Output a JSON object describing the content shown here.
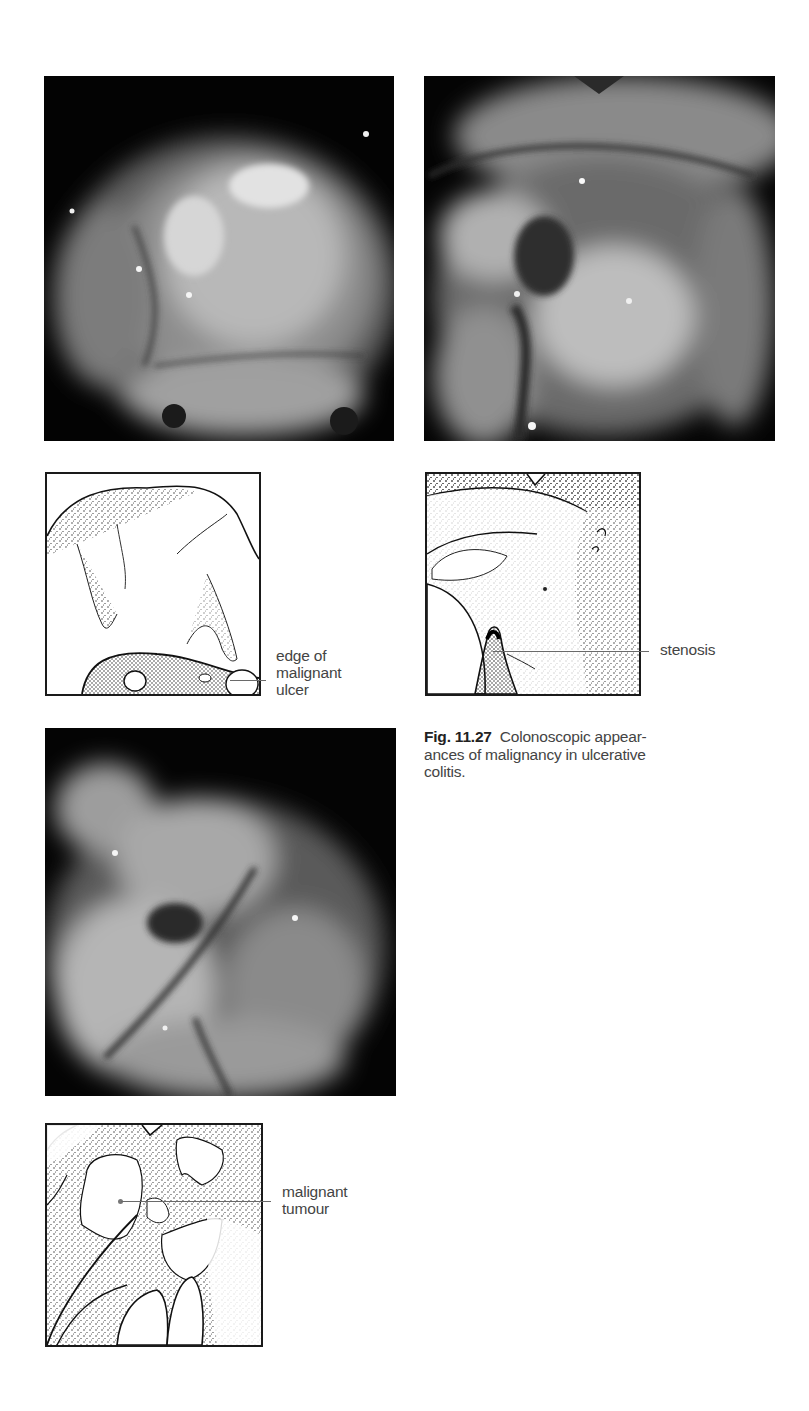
{
  "figure": {
    "number": "Fig. 11.27",
    "caption": "Colonoscopic appear-ances of malignancy in ulcerative colitis.",
    "caption_lines": [
      "Colonoscopic appear-",
      "ances of malignancy in ulcerative",
      "colitis."
    ]
  },
  "panels": [
    {
      "id": "panel-1",
      "photo_description": "endoscopic photograph, greyscale",
      "diagram_label_lines": [
        "edge of",
        "malignant",
        "ulcer"
      ],
      "diagram_label": "edge of malignant ulcer"
    },
    {
      "id": "panel-2",
      "photo_description": "endoscopic photograph, greyscale",
      "diagram_label_lines": [
        "stenosis"
      ],
      "diagram_label": "stenosis"
    },
    {
      "id": "panel-3",
      "photo_description": "endoscopic photograph, greyscale",
      "diagram_label_lines": [
        "malignant",
        "tumour"
      ],
      "diagram_label": "malignant tumour"
    }
  ]
}
